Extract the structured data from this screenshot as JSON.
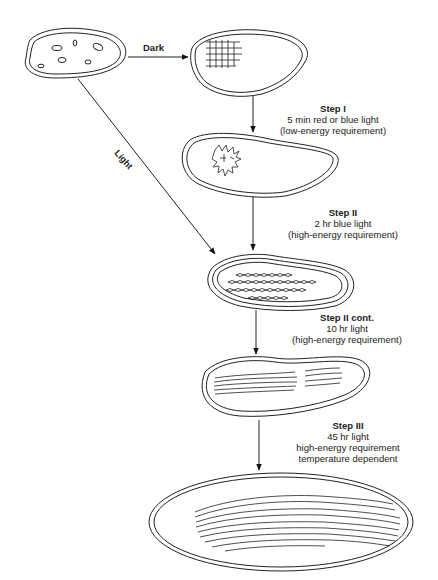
{
  "arrows": {
    "dark_label": "Dark",
    "light_label": "Light"
  },
  "steps": [
    {
      "title": "Step I",
      "lines": [
        "5 min red or blue light",
        "(low-energy requirement)"
      ]
    },
    {
      "title": "Step II",
      "lines": [
        "2 hr blue light",
        "(high-energy requirement)"
      ]
    },
    {
      "title": "Step II cont.",
      "lines": [
        "10 hr light",
        "(high-energy requirement)"
      ]
    },
    {
      "title": "Step III",
      "lines": [
        "45 hr light",
        "high-energy requirement",
        "temperature dependent"
      ]
    }
  ],
  "stages": [
    {
      "name": "proplastid",
      "contents": "scattered vesicles"
    },
    {
      "name": "etioplast",
      "contents": "prolamellar body lattice"
    },
    {
      "name": "step-i-plastid",
      "contents": "dispersing prolamellar body"
    },
    {
      "name": "step-ii-plastid",
      "contents": "vesicle chains"
    },
    {
      "name": "step-ii-cont-plastid",
      "contents": "primary thylakoid stacks"
    },
    {
      "name": "chloroplast",
      "contents": "grana and stroma thylakoids"
    }
  ]
}
